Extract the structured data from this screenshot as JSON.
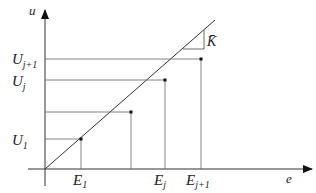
{
  "diagram": {
    "axes": {
      "y_label": "u",
      "x_label": "e"
    },
    "slope_label": "K̄",
    "y_ticks": [
      {
        "label": "U",
        "sub": "j+1"
      },
      {
        "label": "U",
        "sub": "j"
      },
      {
        "label": "U",
        "sub": "1"
      }
    ],
    "x_ticks": [
      {
        "label": "E",
        "sub": "1"
      },
      {
        "label": "E",
        "sub": "j"
      },
      {
        "label": "E",
        "sub": "j+1"
      }
    ]
  }
}
